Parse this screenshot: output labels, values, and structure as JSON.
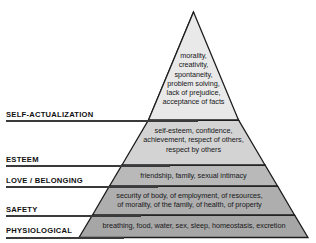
{
  "diagram": {
    "name": "maslows-hierarchy-of-needs-pyramid",
    "tiers": [
      {
        "id": "self-actualization",
        "label": "SELF-ACTUALIZATION",
        "content": "morality,\ncreativity,\nspontaneity,\nproblem solving,\nlack of prejudice,\nacceptance of facts",
        "fill": "#e9e9e9"
      },
      {
        "id": "esteem",
        "label": "ESTEEM",
        "content": "self-esteem, confidence,\nachievement, respect of others,\nrespect by others",
        "fill": "#d3d3d3"
      },
      {
        "id": "love-belonging",
        "label": "LOVE / BELONGING",
        "content": "friendship, family, sexual intimacy",
        "fill": "#b9b9b9"
      },
      {
        "id": "safety",
        "label": "SAFETY",
        "content": "security of body, of employment, of resources,\nof morality, of the family, of health, of property",
        "fill": "#aeaeae"
      },
      {
        "id": "physiological",
        "label": "PHYSIOLOGICAL",
        "content": "breathing, food, water, sex, sleep, homeostasis, excretion",
        "fill": "#a6a6a6"
      }
    ],
    "colors": {
      "outline": "#1d1d1f",
      "rule": "#3a3a3c",
      "label_text": "#101012",
      "body_text": "#18181a",
      "background": "#ffffff"
    }
  }
}
